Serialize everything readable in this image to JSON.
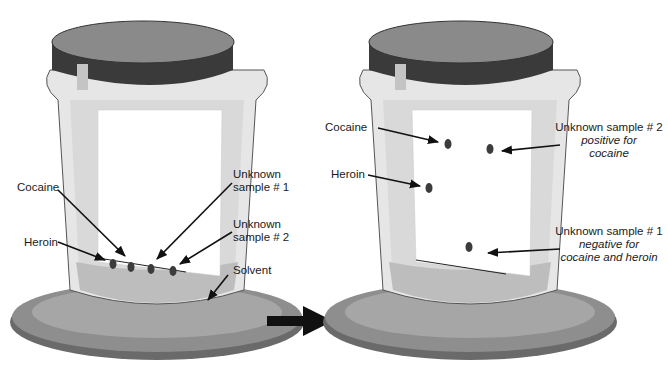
{
  "left_jar": {
    "state": "before",
    "labels": {
      "cocaine": "Cocaine",
      "heroin": "Heroin",
      "unknown1_line1": "Unknown",
      "unknown1_line2": "sample # 1",
      "unknown2_line1": "Unknown",
      "unknown2_line2": "sample # 2",
      "solvent": "Solvent"
    }
  },
  "right_jar": {
    "state": "after",
    "labels": {
      "cocaine": "Cocaine",
      "heroin": "Heroin",
      "unknown2_title": "Unknown sample # 2",
      "unknown2_result_line1": "positive for",
      "unknown2_result_line2": "cocaine",
      "unknown1_title": "Unknown sample # 1",
      "unknown1_result_line1": "negative for",
      "unknown1_result_line2": "cocaine and heroin"
    }
  },
  "colors": {
    "lid_top": "#8a8a8a",
    "lid_band": "#3a3a3a",
    "glass": "#e4e4e4",
    "solvent": "#bdbdbd",
    "dish": "#8e8e8e",
    "spot": "#3c3c3c",
    "arrow": "#111111"
  }
}
